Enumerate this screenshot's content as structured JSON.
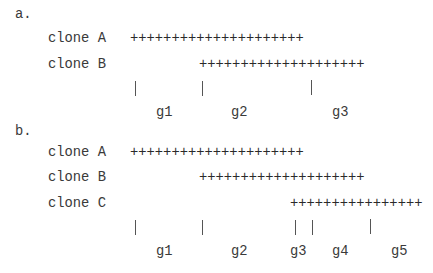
{
  "panel_a": {
    "label": "a.",
    "clones": [
      {
        "name": "clone A",
        "coverage": "+++++++++++++++++++++"
      },
      {
        "name": "clone B",
        "coverage": "++++++++++++++++++++"
      }
    ],
    "genes": [
      "g1",
      "g2",
      "g3"
    ]
  },
  "panel_b": {
    "label": "b.",
    "clones": [
      {
        "name": "clone A",
        "coverage": "+++++++++++++++++++++"
      },
      {
        "name": "clone B",
        "coverage": "++++++++++++++++++++"
      },
      {
        "name": "clone C",
        "coverage": "++++++++++++++++"
      }
    ],
    "genes": [
      "g1",
      "g2",
      "g3",
      "g4",
      "g5"
    ]
  },
  "colors": {
    "text": "#3a3a3a",
    "tick": "#555555",
    "background": "#ffffff"
  }
}
